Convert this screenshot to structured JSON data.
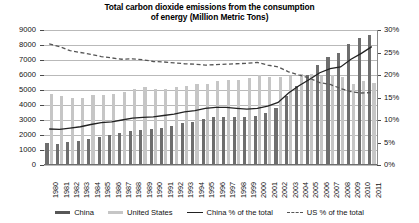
{
  "chart_data": {
    "type": "bar",
    "title": "Total carbon dioxide emissions from the consumption of energy (Million Metric Tons)",
    "title_line1": "Total carbon dioxide emissions from the consumption",
    "title_line2": "of energy (Million Metric Tons)",
    "xlabel": "",
    "ylabel": "",
    "ylim": [
      0,
      9000
    ],
    "y2lim": [
      0,
      30
    ],
    "grid": true,
    "legend_position": "bottom",
    "categories": [
      "1980",
      "1981",
      "1982",
      "1983",
      "1984",
      "1985",
      "1986",
      "1987",
      "1988",
      "1989",
      "1990",
      "1991",
      "1992",
      "1993",
      "1994",
      "1995",
      "1996",
      "1997",
      "1998",
      "1999",
      "2000",
      "2001",
      "2002",
      "2003",
      "2004",
      "2005",
      "2006",
      "2007",
      "2008",
      "2009",
      "2010",
      "2011"
    ],
    "yticks": [
      "0",
      "1000",
      "2000",
      "3000",
      "4000",
      "5000",
      "6000",
      "7000",
      "8000",
      "9000"
    ],
    "y2ticks": [
      "0%",
      "5%",
      "10%",
      "15%",
      "20%",
      "25%",
      "30%"
    ],
    "series": [
      {
        "name": "China",
        "type": "bar",
        "axis": "left",
        "color": "#6e6e6e",
        "values": [
          1448,
          1428,
          1520,
          1620,
          1750,
          1880,
          1980,
          2120,
          2280,
          2360,
          2390,
          2490,
          2600,
          2780,
          2900,
          3100,
          3200,
          3200,
          3180,
          3180,
          3300,
          3500,
          3800,
          4600,
          5300,
          6000,
          6700,
          7200,
          7500,
          8100,
          8500,
          8700
        ]
      },
      {
        "name": "United States",
        "type": "bar",
        "axis": "left",
        "color": "#c6c6c6",
        "values": [
          4760,
          4620,
          4450,
          4450,
          4670,
          4700,
          4720,
          4880,
          5090,
          5180,
          5100,
          5080,
          5170,
          5280,
          5370,
          5420,
          5600,
          5680,
          5700,
          5790,
          5990,
          5860,
          5890,
          5940,
          6040,
          6050,
          5950,
          6030,
          5840,
          5430,
          5630,
          5480
        ]
      },
      {
        "name": "China % of the total",
        "type": "line",
        "axis": "right",
        "color": "#222222",
        "style": "solid",
        "values": [
          8.0,
          7.9,
          8.2,
          8.5,
          9.0,
          9.4,
          9.6,
          10.0,
          10.4,
          10.6,
          10.7,
          11.0,
          11.3,
          11.8,
          12.1,
          12.6,
          12.8,
          12.8,
          12.6,
          12.4,
          12.6,
          13.1,
          13.9,
          16.0,
          17.6,
          19.0,
          20.5,
          21.4,
          21.8,
          23.5,
          24.8,
          26.3
        ]
      },
      {
        "name": "US % of the total",
        "type": "line",
        "axis": "right",
        "color": "#555555",
        "style": "dashed",
        "values": [
          26.9,
          26.3,
          25.4,
          25.0,
          24.6,
          24.1,
          23.8,
          23.5,
          23.6,
          23.4,
          23.0,
          22.9,
          22.7,
          22.5,
          22.4,
          22.2,
          22.3,
          22.4,
          22.5,
          22.6,
          22.8,
          22.2,
          21.8,
          20.7,
          20.0,
          19.3,
          18.3,
          17.9,
          17.0,
          16.3,
          16.0,
          16.1
        ]
      }
    ],
    "legend": [
      {
        "label": "China",
        "marker": "bar-dark"
      },
      {
        "label": "United States",
        "marker": "bar-light"
      },
      {
        "label": "China % of the total",
        "marker": "line-solid"
      },
      {
        "label": "US % of the total",
        "marker": "line-dashed"
      }
    ]
  }
}
